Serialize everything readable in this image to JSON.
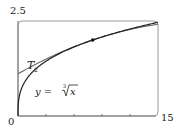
{
  "chart_data": {
    "type": "line",
    "title": "",
    "xlabel": "",
    "ylabel": "",
    "xlim": [
      0,
      15
    ],
    "ylim": [
      0,
      2.5
    ],
    "x_ticks": [
      3,
      6,
      9,
      12
    ],
    "x_tick_labels": {
      "min": "0",
      "max": "15"
    },
    "y_tick_labels": {
      "max": "2.5"
    },
    "grid": false,
    "series": [
      {
        "name": "y = ∛x",
        "function": "cbrt(x)",
        "label_parts": {
          "prefix": "y = ",
          "index": "3",
          "radicand": "x"
        },
        "color": "#333333"
      },
      {
        "name": "T₂",
        "function": "2 + (x-8)/12 - (x-8)^2/288",
        "label": "T",
        "label_sub": "2",
        "color": "#555555"
      }
    ],
    "annotations": [
      {
        "type": "point",
        "x": 8,
        "y": 2,
        "label": "tangent point"
      }
    ]
  },
  "labels": {
    "y_max": "2.5",
    "x_min": "0",
    "x_max": "15",
    "t2_main": "T",
    "t2_sub": "2",
    "curve_prefix": "y = ",
    "curve_index": "3",
    "curve_radicand": "x"
  }
}
